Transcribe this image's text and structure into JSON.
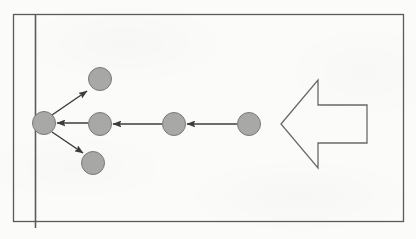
{
  "figure": {
    "domain": "diagram",
    "kind": "particle-scattering-schematic",
    "width": 416,
    "height": 239,
    "background_color": "#fbfbf9",
    "line_color": "#5a5a5a",
    "particle_fill_color": "#a8a8a6",
    "particle_stroke_color": "#7a7a78",
    "arrow_color": "#3c3c3c",
    "big_arrow_stroke_color": "#6a6a6a",
    "big_arrow_fill_color": "none"
  },
  "border": {
    "label": "figure-frame",
    "x": 13.5,
    "y": 14.5,
    "width": 390,
    "height": 207,
    "stroke_width": 1.3
  },
  "wall": {
    "label": "wall-line",
    "x": 35.5,
    "y_top": 14.5,
    "y_bottom": 228,
    "stroke_width": 1.6
  },
  "particles": [
    {
      "name": "wall-particle",
      "cx": 44,
      "cy": 123,
      "r": 11.5
    },
    {
      "name": "scattered-up",
      "cx": 100,
      "cy": 79,
      "r": 11.5
    },
    {
      "name": "scattered-right",
      "cx": 100,
      "cy": 124,
      "r": 11.5
    },
    {
      "name": "scattered-down",
      "cx": 93,
      "cy": 163,
      "r": 11.5
    },
    {
      "name": "incoming-middle",
      "cx": 174,
      "cy": 124,
      "r": 11.5
    },
    {
      "name": "incoming-far",
      "cx": 249,
      "cy": 124,
      "r": 11.5
    }
  ],
  "arrows": [
    {
      "name": "arrow-incoming-far-to-middle",
      "x1": 237,
      "y1": 124,
      "x2": 187,
      "y2": 124,
      "direction": "left"
    },
    {
      "name": "arrow-incoming-middle-to-near",
      "x1": 162,
      "y1": 124,
      "x2": 113,
      "y2": 124,
      "direction": "left"
    },
    {
      "name": "arrow-near-to-wall",
      "x1": 88,
      "y1": 123,
      "x2": 57,
      "y2": 123,
      "direction": "left"
    },
    {
      "name": "arrow-scatter-up",
      "x1": 52,
      "y1": 115,
      "x2": 87,
      "y2": 91,
      "direction": "up-right"
    },
    {
      "name": "arrow-scatter-down",
      "x1": 52,
      "y1": 132,
      "x2": 83,
      "y2": 153,
      "direction": "down-right"
    }
  ],
  "big_arrow": {
    "name": "bulk-flow-arrow",
    "direction": "left",
    "tip_x": 281,
    "tip_y": 124,
    "head_back_x": 318,
    "head_top_y": 80,
    "head_bottom_y": 168,
    "shaft_top_y": 105,
    "shaft_bottom_y": 143,
    "tail_x": 367,
    "stroke_width": 1.3,
    "points": "281,124 318,80 318,105 367,105 367,143 318,143 318,168"
  },
  "accessibility": {
    "description": "Schematic of particles moving leftward toward a vertical wall, where one particle scatters into three outgoing directions; a large hollow arrow at right indicates the overall direction of incoming flow."
  }
}
